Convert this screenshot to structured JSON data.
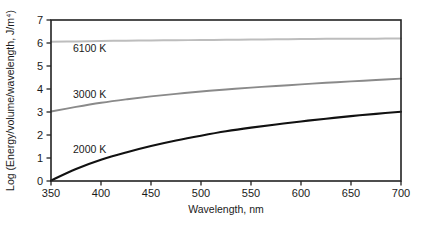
{
  "chart_data": {
    "type": "line",
    "title": "",
    "xlabel": "Wavelength, nm",
    "ylabel": "Log (Energy/volume/wavelength, J/m⁴)",
    "xlim": [
      350,
      700
    ],
    "ylim": [
      0,
      7
    ],
    "xticks": [
      350,
      400,
      450,
      500,
      550,
      600,
      650,
      700
    ],
    "yticks": [
      0,
      1,
      2,
      3,
      4,
      5,
      6,
      7
    ],
    "xtick_labels": [
      "350",
      "400",
      "450",
      "500",
      "550",
      "600",
      "650",
      "700"
    ],
    "ytick_labels": [
      "0",
      "1",
      "2",
      "3",
      "4",
      "5",
      "6",
      "7"
    ],
    "grid": false,
    "legend": "inline-annotations",
    "x": [
      350,
      375,
      400,
      425,
      450,
      475,
      500,
      525,
      550,
      575,
      600,
      625,
      650,
      675,
      700
    ],
    "series": [
      {
        "name": "2000 K",
        "color": "#111111",
        "width": 2.1,
        "label_x": 372,
        "label_y": 1.22,
        "values": [
          0.02,
          0.52,
          0.92,
          1.24,
          1.52,
          1.76,
          1.97,
          2.16,
          2.32,
          2.46,
          2.59,
          2.71,
          2.82,
          2.92,
          3.01
        ]
      },
      {
        "name": "3000 K",
        "color": "#8a8a8a",
        "width": 1.9,
        "label_x": 372,
        "label_y": 3.62,
        "values": [
          3.02,
          3.22,
          3.4,
          3.55,
          3.68,
          3.79,
          3.89,
          3.98,
          4.06,
          4.13,
          4.2,
          4.27,
          4.33,
          4.39,
          4.45
        ]
      },
      {
        "name": "6100 K",
        "color": "#bdbdbd",
        "width": 2.0,
        "label_x": 372,
        "label_y": 5.62,
        "values": [
          6.05,
          6.07,
          6.09,
          6.1,
          6.11,
          6.12,
          6.13,
          6.14,
          6.15,
          6.16,
          6.17,
          6.18,
          6.18,
          6.19,
          6.2
        ]
      }
    ],
    "colors": {
      "axis": "#222222",
      "text": "#1a1a1a",
      "background": "#ffffff"
    },
    "plot_box": {
      "left": 51,
      "top": 20,
      "right": 401,
      "bottom": 181
    }
  }
}
